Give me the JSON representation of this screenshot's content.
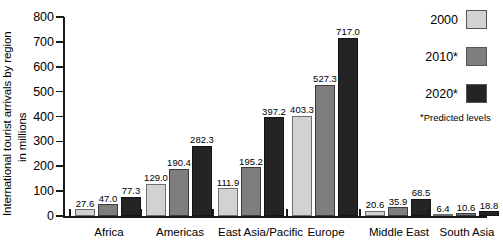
{
  "chart_data": {
    "type": "bar",
    "title": "",
    "xlabel": "",
    "ylabel_line1": "International tourist arrivals by region",
    "ylabel_line2": "in millions",
    "ylim": [
      0,
      800
    ],
    "yticks": [
      0,
      100,
      200,
      300,
      400,
      500,
      600,
      700,
      800
    ],
    "grid": false,
    "legend_position": "right",
    "categories": [
      "Africa",
      "Americas",
      "East Asia/Pacific",
      "Europe",
      "Middle East",
      "South Asia"
    ],
    "series": [
      {
        "name": "2000",
        "color": "#d2d2d2",
        "values": [
          27.6,
          129.0,
          111.9,
          403.3,
          20.6,
          6.4
        ]
      },
      {
        "name": "2010*",
        "color": "#7e7e7e",
        "values": [
          47.0,
          190.4,
          195.2,
          527.3,
          35.9,
          10.6
        ]
      },
      {
        "name": "2020*",
        "color": "#242424",
        "values": [
          77.3,
          282.3,
          397.2,
          717.0,
          68.5,
          18.8
        ]
      }
    ],
    "value_labels": [
      [
        "27.6",
        "47.0",
        "77.3"
      ],
      [
        "129.0",
        "190.4",
        "282.3"
      ],
      [
        "111.9",
        "195.2",
        "397.2"
      ],
      [
        "403.3",
        "527.3",
        "717.0"
      ],
      [
        "20.6",
        "35.9",
        "68.5"
      ],
      [
        "6.4",
        "10.6",
        "18.8"
      ]
    ],
    "annotation": "Predicted levels",
    "annotation_marker": "*"
  },
  "axis": {
    "tick_labels": [
      "800",
      "700",
      "600",
      "500",
      "400",
      "300",
      "200",
      "100",
      "0"
    ]
  },
  "legend": {
    "items": [
      {
        "label": "2000"
      },
      {
        "label": "2010*"
      },
      {
        "label": "2020*"
      }
    ],
    "note": "Predicted levels",
    "note_marker": "*"
  }
}
